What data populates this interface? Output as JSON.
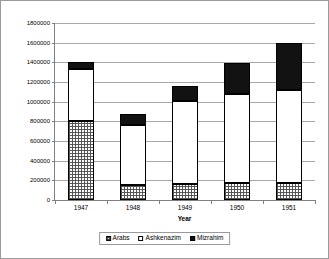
{
  "chart_data": {
    "type": "bar",
    "stacked": true,
    "title": "",
    "xlabel": "Year",
    "ylabel": "",
    "categories": [
      "1947",
      "1948",
      "1949",
      "1950",
      "1951"
    ],
    "series": [
      {
        "name": "Arabs",
        "pattern": "grid",
        "values": [
          800000,
          150000,
          160000,
          170000,
          170000
        ]
      },
      {
        "name": "Ashkenazim",
        "pattern": "white",
        "values": [
          530000,
          610000,
          850000,
          910000,
          950000
        ]
      },
      {
        "name": "Mizrahim",
        "pattern": "solid-black",
        "values": [
          70000,
          110000,
          150000,
          310000,
          480000
        ]
      }
    ],
    "totals": [
      1400000,
      870000,
      1160000,
      1390000,
      1600000
    ],
    "ylim": [
      0,
      1800000
    ],
    "ytick_step": 200000,
    "yticks": [
      "0",
      "200000",
      "400000",
      "600000",
      "800000",
      "1000000",
      "1200000",
      "1400000",
      "1600000",
      "1800000"
    ],
    "grid": true,
    "legend_position": "bottom",
    "colors": {
      "plot_background": "#ffffff",
      "gridline": "#a8a8a8",
      "axis": "#808080",
      "border": "#9a9a9a",
      "mizrahim": "#121212",
      "ashkenazim": "#ffffff",
      "arabs_hatch": "#555555"
    }
  },
  "legend": {
    "entries": [
      {
        "label": "Arabs"
      },
      {
        "label": "Ashkenazim"
      },
      {
        "label": "Mizrahim"
      }
    ]
  }
}
